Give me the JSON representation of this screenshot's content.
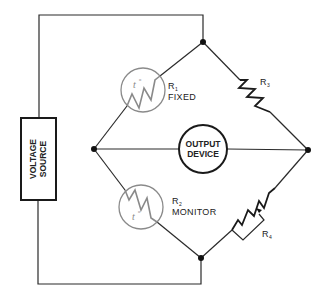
{
  "diagram": {
    "type": "wheatstone-bridge-circuit",
    "voltage_source": {
      "line1": "VOLTAGE",
      "line2": "SOURCE"
    },
    "output_device": {
      "line1": "OUTPUT",
      "line2": "DEVICE"
    },
    "r1": {
      "name": "R",
      "sub": "1",
      "desc": "FIXED",
      "symbol": "t",
      "symbol_sup": "o"
    },
    "r2": {
      "name": "R",
      "sub": "2",
      "desc": "MONITOR",
      "symbol": "t",
      "symbol_sup": "o"
    },
    "r3": {
      "name": "R",
      "sub": "3"
    },
    "r4": {
      "name": "R",
      "sub": "4"
    }
  }
}
